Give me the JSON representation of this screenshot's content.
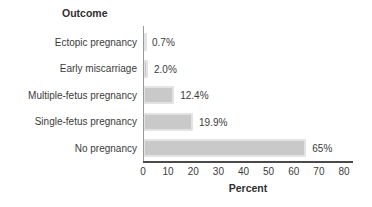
{
  "chart_data": {
    "type": "bar",
    "orientation": "horizontal",
    "title": "Outcome",
    "xlabel": "Percent",
    "categories": [
      "Ectopic pregnancy",
      "Early miscarriage",
      "Multiple-fetus pregnancy",
      "Single-fetus pregnancy",
      "No pregnancy"
    ],
    "values": [
      0.7,
      2.0,
      12.4,
      19.9,
      65
    ],
    "value_labels": [
      "0.7%",
      "2.0%",
      "12.4%",
      "19.9%",
      "65%"
    ],
    "xlim": [
      0,
      80
    ],
    "xticks": [
      0,
      10,
      20,
      30,
      40,
      50,
      60,
      70,
      80
    ],
    "grid": "off",
    "bar_color": "#c9c9c9",
    "bar_edge_color": "#e3e3e3",
    "axis_color": "#4a4a4a",
    "text_color": "#3b3b3b",
    "background_color": "#ffffff"
  }
}
